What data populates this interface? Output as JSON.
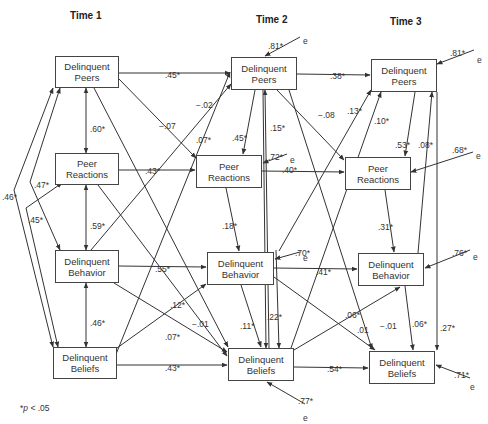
{
  "time_labels": [
    {
      "label": "Time 1",
      "x": 70,
      "y": 10
    },
    {
      "label": "Time 2",
      "x": 256,
      "y": 14
    },
    {
      "label": "Time 3",
      "x": 390,
      "y": 16
    }
  ],
  "nodes": [
    {
      "id": "t1_peers",
      "line1": "Delinquent",
      "line2": "Peers",
      "x": 55,
      "y": 56,
      "w": 64,
      "h": 32
    },
    {
      "id": "t1_reactions",
      "line1": "Peer",
      "line2": "Reactions",
      "x": 55,
      "y": 153,
      "w": 64,
      "h": 32
    },
    {
      "id": "t1_behavior",
      "line1": "Delinquent",
      "line2": "Behavior",
      "x": 55,
      "y": 250,
      "w": 64,
      "h": 33
    },
    {
      "id": "t1_beliefs",
      "line1": "Delinquent",
      "line2": "Beliefs",
      "x": 53,
      "y": 347,
      "w": 64,
      "h": 32
    },
    {
      "id": "t2_peers",
      "line1": "Delinquent",
      "line2": "Peers",
      "x": 231,
      "y": 57,
      "w": 66,
      "h": 33
    },
    {
      "id": "t2_reactions",
      "line1": "Peer",
      "line2": "Reactions",
      "x": 196,
      "y": 155,
      "w": 66,
      "h": 33
    },
    {
      "id": "t2_behavior",
      "line1": "Delinquent",
      "line2": "Behavior",
      "x": 207,
      "y": 252,
      "w": 67,
      "h": 33
    },
    {
      "id": "t2_beliefs",
      "line1": "Delinquent",
      "line2": "Beliefs",
      "x": 228,
      "y": 348,
      "w": 66,
      "h": 33
    },
    {
      "id": "t3_peers",
      "line1": "Delinquent",
      "line2": "Peers",
      "x": 371,
      "y": 59,
      "w": 66,
      "h": 33
    },
    {
      "id": "t3_reactions",
      "line1": "Peer",
      "line2": "Reactions",
      "x": 345,
      "y": 157,
      "w": 66,
      "h": 33
    },
    {
      "id": "t3_behavior",
      "line1": "Delinquent",
      "line2": "Behavior",
      "x": 358,
      "y": 253,
      "w": 66,
      "h": 33
    },
    {
      "id": "t3_beliefs",
      "line1": "Delinquent",
      "line2": "Beliefs",
      "x": 369,
      "y": 351,
      "w": 66,
      "h": 33
    }
  ],
  "paths": [
    {
      "from": [
        119,
        73
      ],
      "to": [
        230,
        73
      ],
      "label": ".45*",
      "lx": 165,
      "ly": 70
    },
    {
      "from": [
        297,
        74
      ],
      "to": [
        370,
        75
      ],
      "label": ".38*",
      "lx": 330,
      "ly": 71
    },
    {
      "from": [
        262,
        171
      ],
      "to": [
        344,
        172
      ],
      "label": ".40*",
      "lx": 282,
      "ly": 165
    },
    {
      "from": [
        119,
        170
      ],
      "to": [
        195,
        170
      ],
      "label": ".43*",
      "lx": 145,
      "ly": 166
    },
    {
      "from": [
        119,
        266
      ],
      "to": [
        206,
        267
      ],
      "label": ".55*",
      "lx": 155,
      "ly": 264
    },
    {
      "from": [
        274,
        268
      ],
      "to": [
        357,
        269
      ],
      "label": ".41*",
      "lx": 316,
      "ly": 267
    },
    {
      "from": [
        117,
        365
      ],
      "to": [
        227,
        365
      ],
      "label": ".43*",
      "lx": 165,
      "ly": 363
    },
    {
      "from": [
        294,
        367
      ],
      "to": [
        368,
        368
      ],
      "label": ".54*",
      "lx": 327,
      "ly": 364
    },
    {
      "from": [
        119,
        79
      ],
      "to": [
        196,
        158
      ],
      "label": "−.07",
      "lx": 159,
      "ly": 121
    },
    {
      "from": [
        94,
        88
      ],
      "to": [
        228,
        347
      ],
      "label": "",
      "lx": 0,
      "ly": 0
    },
    {
      "from": [
        106,
        379
      ],
      "to": [
        230,
        72
      ],
      "label": "−.02",
      "lx": 196,
      "ly": 100
    },
    {
      "from": [
        91,
        250
      ],
      "to": [
        231,
        84
      ],
      "label": ".07*",
      "lx": 196,
      "ly": 135
    },
    {
      "from": [
        117,
        348
      ],
      "to": [
        206,
        284
      ],
      "label": ".12*",
      "lx": 170,
      "ly": 300
    },
    {
      "from": [
        114,
        283
      ],
      "to": [
        227,
        352
      ],
      "label": ".07*",
      "lx": 165,
      "ly": 332
    },
    {
      "from": [
        98,
        185
      ],
      "to": [
        227,
        356
      ],
      "label": "−.01",
      "lx": 192,
      "ly": 319
    },
    {
      "from": [
        255,
        90
      ],
      "to": [
        243,
        154
      ],
      "label": ".45*",
      "lx": 232,
      "ly": 133
    },
    {
      "from": [
        226,
        188
      ],
      "to": [
        239,
        251
      ],
      "label": ".18*",
      "lx": 222,
      "ly": 221
    },
    {
      "from": [
        263,
        90
      ],
      "to": [
        266,
        348
      ],
      "label": "",
      "lx": 0,
      "ly": 0
    },
    {
      "from": [
        269,
        348
      ],
      "to": [
        265,
        90
      ],
      "label": ".15*",
      "lx": 270,
      "ly": 123
    },
    {
      "from": [
        277,
        90
      ],
      "to": [
        344,
        160
      ],
      "label": "−.08",
      "lx": 318,
      "ly": 110
    },
    {
      "from": [
        289,
        90
      ],
      "to": [
        372,
        349
      ],
      "label": "−.01",
      "lx": 380,
      "ly": 321
    },
    {
      "from": [
        279,
        251
      ],
      "to": [
        371,
        90
      ],
      "label": ".13*",
      "lx": 347,
      "ly": 106
    },
    {
      "from": [
        291,
        348
      ],
      "to": [
        381,
        92
      ],
      "label": ".10*",
      "lx": 374,
      "ly": 116
    },
    {
      "from": [
        241,
        285
      ],
      "to": [
        261,
        347
      ],
      "label": ".11*",
      "lx": 240,
      "ly": 321
    },
    {
      "from": [
        276,
        250
      ],
      "to": [
        279,
        348
      ],
      "label": ".22*",
      "lx": 267,
      "ly": 312
    },
    {
      "from": [
        274,
        277
      ],
      "to": [
        375,
        350
      ],
      "label": ".01",
      "lx": 357,
      "ly": 325
    },
    {
      "from": [
        294,
        350
      ],
      "to": [
        400,
        287
      ],
      "label": ".06*",
      "lx": 345,
      "ly": 310
    },
    {
      "from": [
        415,
        92
      ],
      "to": [
        405,
        156
      ],
      "label": ".53*",
      "lx": 395,
      "ly": 140
    },
    {
      "from": [
        418,
        253
      ],
      "to": [
        432,
        92
      ],
      "label": ".08*",
      "lx": 418,
      "ly": 140
    },
    {
      "from": [
        385,
        190
      ],
      "to": [
        394,
        252
      ],
      "label": ".31*",
      "lx": 378,
      "ly": 222
    },
    {
      "from": [
        405,
        286
      ],
      "to": [
        413,
        350
      ],
      "label": ".06*",
      "lx": 412,
      "ly": 319
    },
    {
      "from": [
        437,
        92
      ],
      "to": [
        437,
        350
      ],
      "label": ".27*",
      "lx": 440,
      "ly": 323
    }
  ],
  "correlations": [
    {
      "points": [
        [
          86,
          88
        ],
        [
          86,
          153
        ]
      ],
      "label": ".60*",
      "lx": 90,
      "ly": 124
    },
    {
      "points": [
        [
          86,
          185
        ],
        [
          86,
          250
        ]
      ],
      "label": ".59*",
      "lx": 90,
      "ly": 221
    },
    {
      "points": [
        [
          86,
          283
        ],
        [
          86,
          347
        ]
      ],
      "label": ".46*",
      "lx": 90,
      "ly": 318
    },
    {
      "points": [
        [
          60,
          88
        ],
        [
          30,
          182
        ],
        [
          60,
          250
        ]
      ],
      "label": ".47*",
      "lx": 34,
      "ly": 180
    },
    {
      "points": [
        [
          62,
          183
        ],
        [
          26,
          208
        ],
        [
          58,
          347
        ]
      ],
      "label": ".45*",
      "lx": 28,
      "ly": 215
    },
    {
      "points": [
        [
          53,
          88
        ],
        [
          14,
          190
        ],
        [
          53,
          347
        ]
      ],
      "label": ".46*",
      "lx": 2,
      "ly": 192
    }
  ],
  "errors": [
    {
      "from": [
        300,
        37
      ],
      "to": [
        265,
        56
      ],
      "label": ".81*",
      "lx": 268,
      "ly": 41,
      "ex": 303,
      "ey": 36
    },
    {
      "from": [
        474,
        50
      ],
      "to": [
        437,
        64
      ],
      "label": ".81*",
      "lx": 450,
      "ly": 48,
      "ex": 477,
      "ey": 55
    },
    {
      "from": [
        287,
        154
      ],
      "to": [
        263,
        163
      ],
      "label": ".72*",
      "lx": 268,
      "ly": 152,
      "ex": 290,
      "ey": 155
    },
    {
      "from": [
        473,
        152
      ],
      "to": [
        411,
        172
      ],
      "label": ".68*",
      "lx": 452,
      "ly": 145,
      "ex": 476,
      "ey": 151
    },
    {
      "from": [
        300,
        252
      ],
      "to": [
        275,
        259
      ],
      "label": ".70*",
      "lx": 295,
      "ly": 248,
      "ex": 303,
      "ey": 253
    },
    {
      "from": [
        470,
        250
      ],
      "to": [
        425,
        268
      ],
      "label": ".76*",
      "lx": 452,
      "ly": 248,
      "ex": 473,
      "ey": 252
    },
    {
      "from": [
        470,
        378
      ],
      "to": [
        436,
        365
      ],
      "label": ".71*",
      "lx": 454,
      "ly": 370,
      "ex": 470,
      "ey": 382
    },
    {
      "from": [
        305,
        404
      ],
      "to": [
        267,
        382
      ],
      "label": ".77*",
      "lx": 298,
      "ly": 396,
      "ex": 303,
      "ey": 413
    }
  ],
  "error_symbol": "e",
  "footnote": {
    "prefix": "*",
    "italic": "p",
    "suffix": " < .05"
  },
  "colors": {
    "line": "#333333",
    "text": "#333333"
  }
}
